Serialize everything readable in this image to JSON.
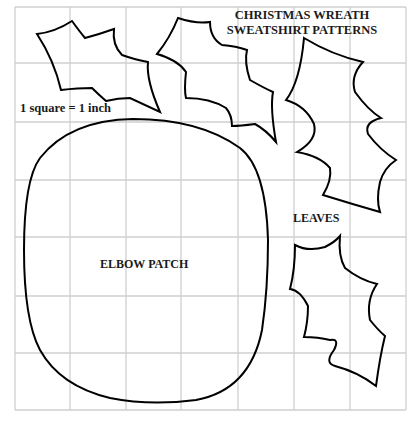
{
  "title": {
    "line1": "CHRISTMAS WREATH",
    "line2": "SWEATSHIRT PATTERNS"
  },
  "scale_note": "1 square = 1 inch",
  "labels": {
    "elbow_patch": "ELBOW PATCH",
    "leaves": "LEAVES"
  },
  "grid": {
    "columns": 7,
    "rows": 7,
    "x_lines": [
      15,
      70,
      126,
      181,
      238,
      294,
      350,
      406
    ],
    "y_lines": [
      7,
      63,
      122,
      180,
      237,
      296,
      353,
      410
    ],
    "line_color": "#cfcfcf"
  },
  "shapes": {
    "outline_color": "#000000",
    "pieces": [
      "holly-leaf-1",
      "holly-leaf-2",
      "holly-leaf-3",
      "holly-leaf-4",
      "elbow-patch"
    ]
  }
}
